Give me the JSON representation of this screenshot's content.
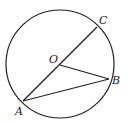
{
  "diagram": {
    "type": "circle-geometry",
    "circle": {
      "cx": 60,
      "cy": 64,
      "r": 54
    },
    "points": {
      "O": {
        "label": "O",
        "x": 60,
        "y": 65,
        "label_x": 49,
        "label_y": 63
      },
      "C": {
        "label": "C",
        "x": 97,
        "y": 27,
        "label_x": 99,
        "label_y": 24
      },
      "B": {
        "label": "B",
        "x": 109,
        "y": 79,
        "label_x": 112,
        "label_y": 84
      },
      "A": {
        "label": "A",
        "x": 23,
        "y": 101,
        "label_x": 15,
        "label_y": 115
      }
    },
    "segments": [
      "AC",
      "OB",
      "AB"
    ],
    "stroke_color": "#222222"
  }
}
